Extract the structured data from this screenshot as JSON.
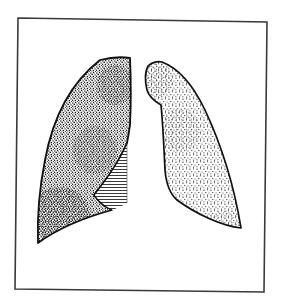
{
  "figure": {
    "alt": "Line drawing of both lungs within a frame; the right lung (viewer's left) is densely stippled with a hatched region along its lower medial border; the left lung (viewer's right) is lightly stippled.",
    "colors": {
      "background": "#ffffff",
      "ink": "#1a1a1a",
      "frame": "#3a3a3a"
    },
    "frame": {
      "corners": [
        [
          18,
          18
        ],
        [
          267,
          22
        ],
        [
          264,
          292
        ],
        [
          15,
          289
        ]
      ]
    },
    "right_lung": {
      "label": "Right lung",
      "shading": "dense stipple"
    },
    "hatched_region": {
      "label": "Hatched region",
      "shading": "horizontal hatching"
    },
    "left_lung": {
      "label": "Left lung",
      "shading": "light stipple"
    }
  }
}
